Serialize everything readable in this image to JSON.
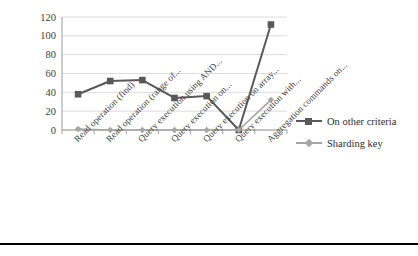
{
  "chart_data": {
    "type": "line",
    "title": "",
    "xlabel": "",
    "ylabel": "",
    "ylim": [
      0,
      120
    ],
    "ytick_step": 20,
    "yticks": [
      120,
      100,
      80,
      60,
      40,
      20,
      0
    ],
    "grid": true,
    "legend_position": "right",
    "categories": [
      "Read operation (find)",
      "Read operation (range of...",
      "Query execution using AND...",
      "Query execution on...",
      "Query execution on array...",
      "Query execution with...",
      "Aggregation commands on..."
    ],
    "series": [
      {
        "name": "On other criteria",
        "color": "#595959",
        "marker": "square",
        "values": [
          38,
          52,
          53,
          34,
          36,
          0,
          112
        ]
      },
      {
        "name": "Sharding key",
        "color": "#a6a6a6",
        "marker": "diamond",
        "values": [
          1,
          0,
          0,
          0,
          0,
          0,
          32
        ]
      }
    ]
  },
  "legend": {
    "items": [
      {
        "label": "On other criteria"
      },
      {
        "label": "Sharding key"
      }
    ]
  },
  "colors": {
    "series_primary": "#595959",
    "series_secondary": "#a6a6a6",
    "gridline": "#d4d4d4",
    "axis": "#9a9a9a",
    "text": "#404040",
    "rule": "#000000"
  }
}
